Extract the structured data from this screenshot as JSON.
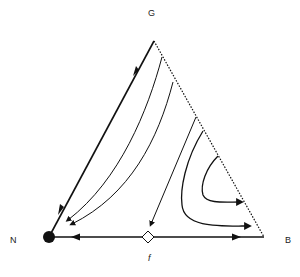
{
  "diagram": {
    "type": "ternary-phase-portrait",
    "vertices": {
      "top": {
        "label": "G"
      },
      "left": {
        "label": "N"
      },
      "right": {
        "label": "B"
      }
    },
    "bottom_label": "f",
    "edges": {
      "N-G": "solid",
      "G-B": "dotted",
      "N-B": "solid"
    },
    "fixed_points": [
      {
        "at": "N",
        "kind": "stable",
        "shape": "filled-circle"
      },
      {
        "at": "N-B edge",
        "kind": "unstable",
        "shape": "open-diamond"
      }
    ],
    "trajectories": [
      {
        "from": "G",
        "to": "N",
        "path": "along left edge"
      },
      {
        "from": "near G on dotted edge",
        "to": "near N",
        "path": "curve"
      },
      {
        "from": "dotted edge (upper)",
        "to": "near N",
        "path": "curve"
      },
      {
        "from": "dotted edge (middle)",
        "to": "bottom edge near diamond",
        "path": "straight"
      },
      {
        "from": "dotted edge (middle)",
        "to": "near B",
        "path": "U-curve"
      },
      {
        "from": "dotted edge (lower)",
        "to": "near B",
        "path": "small U-curve"
      },
      {
        "from": "diamond",
        "to": "N",
        "path": "along bottom edge"
      },
      {
        "from": "diamond",
        "to": "B",
        "path": "along bottom edge"
      }
    ],
    "colors": {
      "line": "#111111",
      "background": "#ffffff"
    }
  }
}
